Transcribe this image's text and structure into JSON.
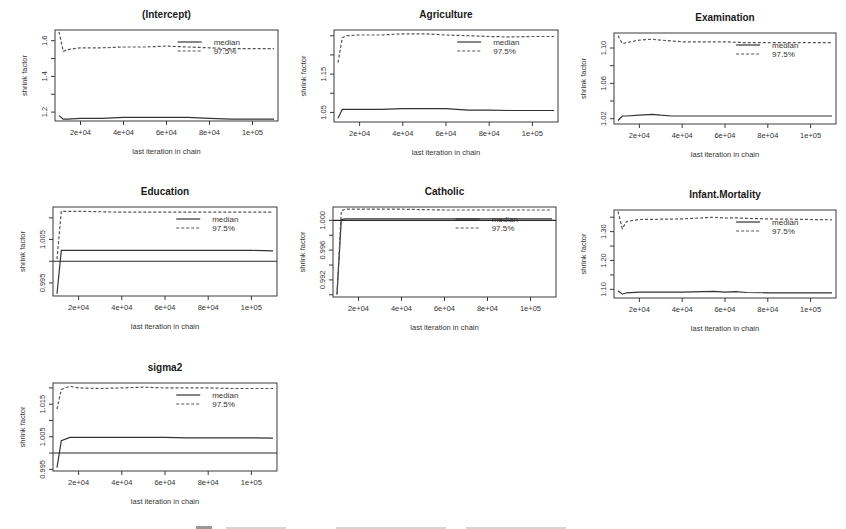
{
  "figure": {
    "caption_visible": false
  },
  "chart_data": [
    {
      "type": "line",
      "title": "(Intercept)",
      "xlabel": "last iteration in chain",
      "ylabel": "shrink factor",
      "xticks": [
        20000,
        40000,
        60000,
        80000,
        100000
      ],
      "xtick_labels": [
        "2e+04",
        "4e+04",
        "6e+04",
        "8e+04",
        "1e+05"
      ],
      "xlim": [
        10000,
        110000
      ],
      "ylim": [
        1.15,
        1.66
      ],
      "yticks": [
        1.2,
        1.3,
        1.4,
        1.5,
        1.6
      ],
      "ytick_labels": [
        "1.2",
        "",
        "1.4",
        "",
        "1.6"
      ],
      "reference_line": null,
      "legend": [
        "median",
        "97.5%"
      ],
      "legend_position": "top-right",
      "box": [
        55,
        30,
        278,
        121
      ],
      "x": [
        10000,
        12000,
        14000,
        20000,
        30000,
        40000,
        50000,
        60000,
        70000,
        80000,
        90000,
        100000,
        110000
      ],
      "series": [
        {
          "name": "median",
          "style": "solid",
          "values": [
            1.18,
            1.16,
            1.16,
            1.165,
            1.165,
            1.17,
            1.17,
            1.17,
            1.17,
            1.165,
            1.16,
            1.16,
            1.16
          ]
        },
        {
          "name": "97.5%",
          "style": "dashed",
          "values": [
            1.65,
            1.54,
            1.55,
            1.56,
            1.56,
            1.565,
            1.565,
            1.57,
            1.565,
            1.56,
            1.555,
            1.555,
            1.555
          ]
        }
      ]
    },
    {
      "type": "line",
      "title": "Agriculture",
      "xlabel": "last iteration in chain",
      "ylabel": "shrink factor",
      "xticks": [
        20000,
        40000,
        60000,
        80000,
        100000
      ],
      "xtick_labels": [
        "2e+04",
        "4e+04",
        "6e+04",
        "8e+04",
        "1e+05"
      ],
      "xlim": [
        10000,
        110000
      ],
      "ylim": [
        1.025,
        1.265
      ],
      "yticks": [
        1.05,
        1.1,
        1.15,
        1.2,
        1.25
      ],
      "ytick_labels": [
        "1.05",
        "",
        "1.15",
        "",
        ""
      ],
      "reference_line": null,
      "legend": [
        "median",
        "97.5%"
      ],
      "legend_position": "top-right",
      "box": [
        334,
        30,
        558,
        122
      ],
      "x": [
        10000,
        12000,
        14000,
        20000,
        30000,
        40000,
        50000,
        60000,
        70000,
        80000,
        90000,
        100000,
        110000
      ],
      "series": [
        {
          "name": "median",
          "style": "solid",
          "values": [
            1.035,
            1.058,
            1.058,
            1.058,
            1.058,
            1.06,
            1.06,
            1.06,
            1.056,
            1.056,
            1.055,
            1.055,
            1.055
          ]
        },
        {
          "name": "97.5%",
          "style": "dashed",
          "values": [
            1.18,
            1.245,
            1.25,
            1.252,
            1.252,
            1.255,
            1.255,
            1.252,
            1.25,
            1.248,
            1.247,
            1.248,
            1.248
          ]
        }
      ]
    },
    {
      "type": "line",
      "title": "Examination",
      "xlabel": "last iteration in chain",
      "ylabel": "shrink factor",
      "xticks": [
        20000,
        40000,
        60000,
        80000,
        100000
      ],
      "xtick_labels": [
        "2e+04",
        "4e+04",
        "6e+04",
        "8e+04",
        "1e+05"
      ],
      "xlim": [
        10000,
        110000
      ],
      "ylim": [
        1.014,
        1.117
      ],
      "yticks": [
        1.02,
        1.04,
        1.06,
        1.08,
        1.1
      ],
      "ytick_labels": [
        "1.02",
        "",
        "1.06",
        "",
        "1.10"
      ],
      "reference_line": null,
      "legend": [
        "median",
        "97.5%"
      ],
      "legend_position": "top-right",
      "box": [
        614,
        33,
        836,
        124
      ],
      "x": [
        10000,
        12000,
        14000,
        20000,
        26000,
        30000,
        35000,
        40000,
        50000,
        60000,
        70000,
        80000,
        90000,
        100000,
        110000
      ],
      "series": [
        {
          "name": "median",
          "style": "solid",
          "values": [
            1.018,
            1.023,
            1.023,
            1.024,
            1.025,
            1.024,
            1.023,
            1.023,
            1.023,
            1.023,
            1.023,
            1.023,
            1.023,
            1.023,
            1.023
          ]
        },
        {
          "name": "97.5%",
          "style": "dashed",
          "values": [
            1.114,
            1.105,
            1.106,
            1.109,
            1.11,
            1.109,
            1.108,
            1.107,
            1.107,
            1.107,
            1.106,
            1.106,
            1.106,
            1.106,
            1.106
          ]
        }
      ]
    },
    {
      "type": "line",
      "title": "Education",
      "xlabel": "last iteration in chain",
      "ylabel": "shrink factor",
      "xticks": [
        20000,
        40000,
        60000,
        80000,
        100000
      ],
      "xtick_labels": [
        "2e+04",
        "4e+04",
        "6e+04",
        "8e+04",
        "1e+05"
      ],
      "xlim": [
        10000,
        110000
      ],
      "ylim": [
        0.992,
        1.0125
      ],
      "yticks": [
        0.995,
        1.0,
        1.005,
        1.01
      ],
      "ytick_labels": [
        "0.995",
        "",
        "1.005",
        ""
      ],
      "reference_line": 1.0,
      "legend": [
        "median",
        "97.5%"
      ],
      "legend_position": "top-right",
      "box": [
        53,
        207,
        277,
        296
      ],
      "x": [
        10000,
        12000,
        14000,
        20000,
        40000,
        60000,
        80000,
        100000,
        110000
      ],
      "series": [
        {
          "name": "median",
          "style": "solid",
          "values": [
            0.9925,
            1.0025,
            1.0025,
            1.0025,
            1.0025,
            1.0025,
            1.0025,
            1.0025,
            1.0024
          ]
        },
        {
          "name": "97.5%",
          "style": "dashed",
          "values": [
            1.0005,
            1.0115,
            1.0115,
            1.0115,
            1.0113,
            1.0113,
            1.0113,
            1.0113,
            1.0113
          ]
        }
      ]
    },
    {
      "type": "line",
      "title": "Catholic",
      "xlabel": "last iteration in chain",
      "ylabel": "shrink factor",
      "xticks": [
        20000,
        40000,
        60000,
        80000,
        100000
      ],
      "xtick_labels": [
        "2e+04",
        "4e+04",
        "6e+04",
        "8e+04",
        "1e+05"
      ],
      "xlim": [
        10000,
        110000
      ],
      "ylim": [
        0.9897,
        1.0018
      ],
      "yticks": [
        0.99,
        0.992,
        0.994,
        0.996,
        0.998,
        1.0
      ],
      "ytick_labels": [
        "",
        "0.992",
        "",
        "0.996",
        "",
        "1.000"
      ],
      "reference_line": 1.0,
      "legend": [
        "median",
        "97.5%"
      ],
      "legend_position": "top-right",
      "box": [
        333,
        207,
        556,
        297
      ],
      "x": [
        10000,
        12000,
        14000,
        20000,
        40000,
        60000,
        80000,
        100000,
        110000
      ],
      "series": [
        {
          "name": "median",
          "style": "solid",
          "values": [
            0.9901,
            1.0001,
            1.0002,
            1.0002,
            1.0002,
            1.0002,
            1.0002,
            1.0002,
            1.0002
          ]
        },
        {
          "name": "97.5%",
          "style": "dashed",
          "values": [
            0.99,
            1.0013,
            1.0015,
            1.0015,
            1.0015,
            1.0014,
            1.0014,
            1.0014,
            1.0014
          ]
        }
      ]
    },
    {
      "type": "line",
      "title": "Infant.Mortality",
      "xlabel": "last iteration in chain",
      "ylabel": "shrink factor",
      "xticks": [
        20000,
        40000,
        60000,
        80000,
        100000
      ],
      "xtick_labels": [
        "2e+04",
        "4e+04",
        "6e+04",
        "8e+04",
        "1e+05"
      ],
      "xlim": [
        10000,
        110000
      ],
      "ylim": [
        1.07,
        1.375
      ],
      "yticks": [
        1.1,
        1.15,
        1.2,
        1.25,
        1.3,
        1.35
      ],
      "ytick_labels": [
        "1.10",
        "",
        "1.20",
        "",
        "1.30",
        ""
      ],
      "reference_line": null,
      "legend": [
        "median",
        "97.5%"
      ],
      "legend_position": "top-right",
      "box": [
        614,
        210,
        836,
        298
      ],
      "x": [
        10000,
        12000,
        14000,
        20000,
        30000,
        40000,
        50000,
        55000,
        60000,
        65000,
        70000,
        80000,
        90000,
        100000,
        110000
      ],
      "series": [
        {
          "name": "median",
          "style": "solid",
          "values": [
            1.095,
            1.083,
            1.088,
            1.09,
            1.09,
            1.09,
            1.092,
            1.093,
            1.09,
            1.092,
            1.089,
            1.088,
            1.088,
            1.088,
            1.088
          ]
        },
        {
          "name": "97.5%",
          "style": "dashed",
          "values": [
            1.37,
            1.31,
            1.335,
            1.342,
            1.343,
            1.344,
            1.348,
            1.35,
            1.347,
            1.348,
            1.346,
            1.344,
            1.343,
            1.342,
            1.341
          ]
        }
      ]
    },
    {
      "type": "line",
      "title": "sigma2",
      "xlabel": "last iteration in chain",
      "ylabel": "shrink factor",
      "xticks": [
        20000,
        40000,
        60000,
        80000,
        100000
      ],
      "xtick_labels": [
        "2e+04",
        "4e+04",
        "6e+04",
        "8e+04",
        "1e+05"
      ],
      "xlim": [
        10000,
        110000
      ],
      "ylim": [
        0.9945,
        1.0215
      ],
      "yticks": [
        0.995,
        1.0,
        1.005,
        1.01,
        1.015,
        1.02
      ],
      "ytick_labels": [
        "0.995",
        "",
        "1.005",
        "",
        "1.015",
        ""
      ],
      "reference_line": 1.0,
      "legend": [
        "median",
        "97.5%"
      ],
      "legend_position": "top-right",
      "box": [
        53,
        383,
        277,
        471
      ],
      "x": [
        10000,
        12000,
        16000,
        20000,
        30000,
        40000,
        50000,
        60000,
        70000,
        80000,
        90000,
        100000,
        110000
      ],
      "series": [
        {
          "name": "median",
          "style": "solid",
          "values": [
            0.9955,
            1.0038,
            1.0048,
            1.0048,
            1.0048,
            1.0048,
            1.0048,
            1.0048,
            1.0047,
            1.0047,
            1.0047,
            1.0047,
            1.0046
          ]
        },
        {
          "name": "97.5%",
          "style": "dashed",
          "values": [
            1.0135,
            1.0195,
            1.0205,
            1.02,
            1.0198,
            1.02,
            1.0202,
            1.02,
            1.02,
            1.02,
            1.0198,
            1.0198,
            1.0198
          ]
        }
      ]
    }
  ]
}
